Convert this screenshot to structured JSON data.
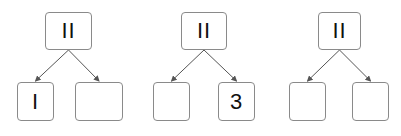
{
  "diagram": {
    "trees": [
      {
        "root": {
          "label": "II",
          "x": 45,
          "y": 12,
          "w": 47,
          "h": 38
        },
        "left": {
          "label": "I",
          "x": 17,
          "y": 82,
          "w": 37,
          "h": 39
        },
        "right": {
          "label": "",
          "x": 75,
          "y": 82,
          "w": 48,
          "h": 39
        }
      },
      {
        "root": {
          "label": "II",
          "x": 181,
          "y": 12,
          "w": 46,
          "h": 38
        },
        "left": {
          "label": "",
          "x": 153,
          "y": 82,
          "w": 37,
          "h": 39
        },
        "right": {
          "label": "3",
          "x": 218,
          "y": 82,
          "w": 37,
          "h": 39
        }
      },
      {
        "root": {
          "label": "II",
          "x": 318,
          "y": 12,
          "w": 43,
          "h": 38
        },
        "left": {
          "label": "",
          "x": 289,
          "y": 82,
          "w": 37,
          "h": 39
        },
        "right": {
          "label": "",
          "x": 352,
          "y": 82,
          "w": 37,
          "h": 39
        }
      }
    ],
    "edge_color": "#555555"
  }
}
